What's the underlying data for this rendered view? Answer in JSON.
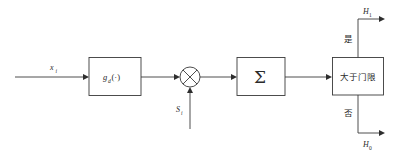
{
  "diagram": {
    "background_color": "#ffffff",
    "line_color": "#3a3a3a",
    "text_color": "#2b2b2b",
    "input": {
      "label_base": "x",
      "label_sub": "i",
      "name": "input-signal-label"
    },
    "nonlinearity_block": {
      "label_base": "g",
      "label_sub": "d",
      "label_tail": "(·)",
      "name": "nonlinearity-block"
    },
    "multiplier": {
      "glyph": "multiply-circle",
      "name": "multiplier-node"
    },
    "reference_input": {
      "label_base": "S",
      "label_sub": "i",
      "name": "reference-signal-label"
    },
    "summation_block": {
      "label": "Σ",
      "name": "summation-block"
    },
    "decision_block": {
      "label": "大于门限",
      "name": "threshold-decision-block"
    },
    "branch_yes": {
      "label": "是",
      "output_base": "H",
      "output_sub": "1"
    },
    "branch_no": {
      "label": "否",
      "output_base": "H",
      "output_sub": "0"
    }
  }
}
